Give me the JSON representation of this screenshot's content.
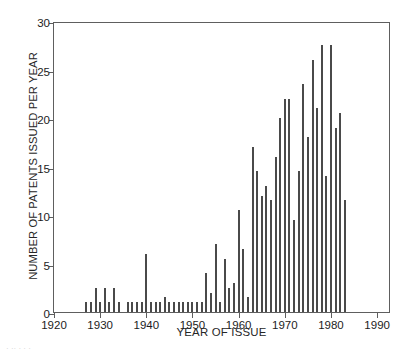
{
  "chart_data": {
    "type": "bar",
    "title": "",
    "xlabel": "YEAR OF ISSUE",
    "ylabel": "NUMBER OF PATENTS ISSUED PER YEAR",
    "xlim": [
      1920,
      1993
    ],
    "ylim": [
      0,
      30
    ],
    "grid": false,
    "legend": null,
    "xticks": [
      1920,
      1930,
      1940,
      1950,
      1960,
      1970,
      1980,
      1990
    ],
    "xtick_labels": [
      "1920",
      "1930",
      "1940",
      "1950",
      "1960",
      "1970",
      "1980",
      "1990"
    ],
    "yticks": [
      0,
      5,
      10,
      15,
      20,
      25,
      30
    ],
    "ytick_labels": [
      "0",
      "5",
      "10",
      "15",
      "20",
      "25",
      "30"
    ],
    "x": [
      1927,
      1928,
      1929,
      1930,
      1931,
      1932,
      1933,
      1934,
      1936,
      1937,
      1938,
      1939,
      1940,
      1941,
      1942,
      1943,
      1944,
      1945,
      1946,
      1947,
      1948,
      1949,
      1950,
      1951,
      1952,
      1953,
      1954,
      1955,
      1956,
      1957,
      1958,
      1959,
      1960,
      1961,
      1962,
      1963,
      1964,
      1965,
      1966,
      1967,
      1968,
      1969,
      1970,
      1971,
      1972,
      1973,
      1974,
      1975,
      1976,
      1977,
      1978,
      1979,
      1980,
      1981,
      1982,
      1983
    ],
    "values": [
      1,
      1,
      2.5,
      1,
      2.5,
      1,
      2.5,
      1,
      1,
      1,
      1,
      1,
      6,
      1,
      1,
      1,
      1.5,
      1,
      1,
      1,
      1,
      1,
      1,
      1,
      1,
      4,
      2,
      7,
      1,
      5.5,
      2.5,
      3,
      10.5,
      6.5,
      1.5,
      17,
      14.5,
      12,
      13,
      11.5,
      16,
      20,
      22,
      22,
      9.5,
      14.5,
      23.5,
      18,
      26,
      21,
      27.5,
      14,
      27.5,
      19,
      20.5,
      11.5
    ],
    "bar_color": "#4a4a4a",
    "axis_color": "#5e5e5e"
  },
  "caption_remnant": "· ·· ·        ·    ·"
}
